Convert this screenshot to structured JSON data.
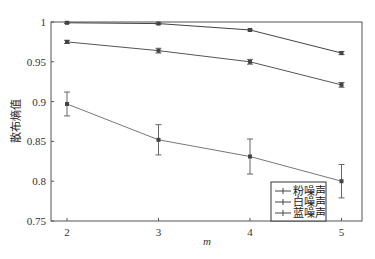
{
  "chart_data": {
    "type": "line",
    "title": "",
    "xlabel": "m",
    "ylabel": "散布熵值",
    "x": [
      2,
      3,
      4,
      5
    ],
    "xticks": [
      "2",
      "3",
      "4",
      "5"
    ],
    "yticks": [
      "0.75",
      "0.8",
      "0.85",
      "0.9",
      "0.95",
      "1"
    ],
    "ylim": [
      0.75,
      1.0
    ],
    "xlim": [
      1.83,
      5.22
    ],
    "grid": false,
    "legend_position": "lower right",
    "series": [
      {
        "name": "粉噪声",
        "values": [
          0.897,
          0.852,
          0.831,
          0.8
        ],
        "errors": [
          0.015,
          0.019,
          0.022,
          0.021
        ]
      },
      {
        "name": "白噪声",
        "values": [
          0.999,
          0.998,
          0.99,
          0.961
        ],
        "errors": [
          0.001,
          0.001,
          0.001,
          0.002
        ]
      },
      {
        "name": "蓝噪声",
        "values": [
          0.975,
          0.964,
          0.95,
          0.921
        ],
        "errors": [
          0.002,
          0.003,
          0.003,
          0.003
        ]
      }
    ]
  }
}
